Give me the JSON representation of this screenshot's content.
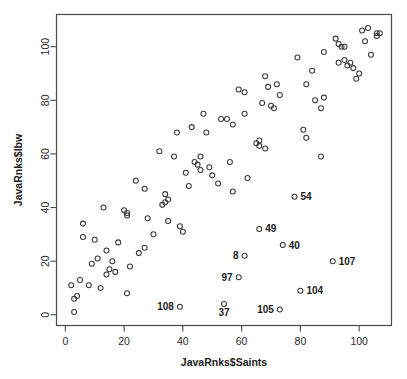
{
  "chart_data": {
    "type": "scatter",
    "title": "",
    "xlabel": "JavaRnks$Saints",
    "ylabel": "JavaRnks$lbw",
    "xlim": [
      -3,
      111
    ],
    "ylim": [
      -4,
      112
    ],
    "xticks": [
      0,
      20,
      40,
      60,
      80,
      100
    ],
    "yticks": [
      0,
      20,
      40,
      60,
      80,
      100
    ],
    "grid": false,
    "legend": null,
    "marker": "open-circle",
    "marker_color": "#3a3a3a",
    "points": [
      {
        "x": 2,
        "y": 11
      },
      {
        "x": 3,
        "y": 6
      },
      {
        "x": 3,
        "y": 1
      },
      {
        "x": 4,
        "y": 7
      },
      {
        "x": 5,
        "y": 13
      },
      {
        "x": 6,
        "y": 29
      },
      {
        "x": 6,
        "y": 34
      },
      {
        "x": 8,
        "y": 11
      },
      {
        "x": 9,
        "y": 19
      },
      {
        "x": 10,
        "y": 28
      },
      {
        "x": 11,
        "y": 21
      },
      {
        "x": 12,
        "y": 10
      },
      {
        "x": 13,
        "y": 40
      },
      {
        "x": 14,
        "y": 24
      },
      {
        "x": 14,
        "y": 15
      },
      {
        "x": 15,
        "y": 17
      },
      {
        "x": 16,
        "y": 20
      },
      {
        "x": 17,
        "y": 16
      },
      {
        "x": 18,
        "y": 27
      },
      {
        "x": 20,
        "y": 39
      },
      {
        "x": 21,
        "y": 38
      },
      {
        "x": 21,
        "y": 37
      },
      {
        "x": 21,
        "y": 8
      },
      {
        "x": 22,
        "y": 18
      },
      {
        "x": 24,
        "y": 50
      },
      {
        "x": 25,
        "y": 23
      },
      {
        "x": 27,
        "y": 47
      },
      {
        "x": 27,
        "y": 25
      },
      {
        "x": 28,
        "y": 36
      },
      {
        "x": 30,
        "y": 30
      },
      {
        "x": 32,
        "y": 61
      },
      {
        "x": 33,
        "y": 41
      },
      {
        "x": 34,
        "y": 45
      },
      {
        "x": 34,
        "y": 42
      },
      {
        "x": 35,
        "y": 43
      },
      {
        "x": 35,
        "y": 35
      },
      {
        "x": 37,
        "y": 59
      },
      {
        "x": 38,
        "y": 68
      },
      {
        "x": 39,
        "y": 33
      },
      {
        "x": 40,
        "y": 31
      },
      {
        "x": 41,
        "y": 53
      },
      {
        "x": 42,
        "y": 48
      },
      {
        "x": 43,
        "y": 70
      },
      {
        "x": 44,
        "y": 57
      },
      {
        "x": 45,
        "y": 56
      },
      {
        "x": 46,
        "y": 59
      },
      {
        "x": 46,
        "y": 54
      },
      {
        "x": 47,
        "y": 75
      },
      {
        "x": 48,
        "y": 68
      },
      {
        "x": 49,
        "y": 55
      },
      {
        "x": 50,
        "y": 52
      },
      {
        "x": 52,
        "y": 49
      },
      {
        "x": 53,
        "y": 73
      },
      {
        "x": 55,
        "y": 73
      },
      {
        "x": 56,
        "y": 57
      },
      {
        "x": 57,
        "y": 71
      },
      {
        "x": 57,
        "y": 46
      },
      {
        "x": 59,
        "y": 84
      },
      {
        "x": 61,
        "y": 83
      },
      {
        "x": 61,
        "y": 75
      },
      {
        "x": 62,
        "y": 51
      },
      {
        "x": 65,
        "y": 64
      },
      {
        "x": 66,
        "y": 65
      },
      {
        "x": 66,
        "y": 63
      },
      {
        "x": 67,
        "y": 79
      },
      {
        "x": 68,
        "y": 62
      },
      {
        "x": 68,
        "y": 89
      },
      {
        "x": 69,
        "y": 85
      },
      {
        "x": 70,
        "y": 78
      },
      {
        "x": 71,
        "y": 77
      },
      {
        "x": 72,
        "y": 86
      },
      {
        "x": 73,
        "y": 82
      },
      {
        "x": 79,
        "y": 96
      },
      {
        "x": 81,
        "y": 69
      },
      {
        "x": 82,
        "y": 66
      },
      {
        "x": 82,
        "y": 86
      },
      {
        "x": 84,
        "y": 91
      },
      {
        "x": 85,
        "y": 80
      },
      {
        "x": 87,
        "y": 59
      },
      {
        "x": 87,
        "y": 77
      },
      {
        "x": 88,
        "y": 81
      },
      {
        "x": 88,
        "y": 98
      },
      {
        "x": 92,
        "y": 103
      },
      {
        "x": 93,
        "y": 101
      },
      {
        "x": 93,
        "y": 94
      },
      {
        "x": 94,
        "y": 100
      },
      {
        "x": 95,
        "y": 100
      },
      {
        "x": 95,
        "y": 95
      },
      {
        "x": 96,
        "y": 93
      },
      {
        "x": 97,
        "y": 94
      },
      {
        "x": 98,
        "y": 92
      },
      {
        "x": 99,
        "y": 88
      },
      {
        "x": 100,
        "y": 90
      },
      {
        "x": 101,
        "y": 106
      },
      {
        "x": 102,
        "y": 102
      },
      {
        "x": 103,
        "y": 107
      },
      {
        "x": 104,
        "y": 97
      },
      {
        "x": 106,
        "y": 105
      },
      {
        "x": 106,
        "y": 104
      },
      {
        "x": 107,
        "y": 105
      }
    ],
    "labeled_points": [
      {
        "label": "54",
        "x": 78,
        "y": 44,
        "label_side": "right"
      },
      {
        "label": "49",
        "x": 66,
        "y": 32,
        "label_side": "right"
      },
      {
        "label": "40",
        "x": 74,
        "y": 26,
        "label_side": "right"
      },
      {
        "label": "107",
        "x": 91,
        "y": 20,
        "label_side": "right"
      },
      {
        "label": "104",
        "x": 80,
        "y": 9,
        "label_side": "right"
      },
      {
        "label": "105",
        "x": 73,
        "y": 2,
        "label_side": "left"
      },
      {
        "label": "8",
        "x": 61,
        "y": 22,
        "label_side": "left"
      },
      {
        "label": "97",
        "x": 59,
        "y": 14,
        "label_side": "left"
      },
      {
        "label": "37",
        "x": 54,
        "y": 4,
        "label_side": "below"
      },
      {
        "label": "108",
        "x": 39,
        "y": 3,
        "label_side": "left"
      }
    ]
  },
  "axes": {
    "x_tick_labels": [
      "0",
      "20",
      "40",
      "60",
      "80",
      "100"
    ],
    "y_tick_labels": [
      "0",
      "20",
      "40",
      "60",
      "80",
      "100"
    ],
    "x_title": "JavaRnks$Saints",
    "y_title": "JavaRnks$lbw"
  },
  "colors": {
    "background": "#ffffff",
    "frame": "#4a4a4a",
    "marker": "#3a3a3a",
    "text": "#1c1c1c"
  }
}
